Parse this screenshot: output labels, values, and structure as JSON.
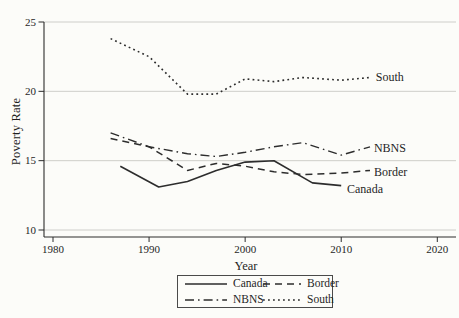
{
  "figure": {
    "background": "#fcfcf9",
    "line_color": "#2d2d2d",
    "grid_color": "#c9c9c4",
    "text_color": "#1f1f1f"
  },
  "chart_data": {
    "type": "line",
    "title": "",
    "xlabel": "Year",
    "ylabel": "Poverty Rate",
    "xlim": [
      1980,
      2020
    ],
    "ylim": [
      10,
      25
    ],
    "x_ticks": [
      1980,
      1990,
      2000,
      2010,
      2020
    ],
    "y_ticks": [
      10,
      15,
      20,
      25
    ],
    "grid": "horizontal-only",
    "legend_position": "bottom-center-boxed",
    "series": [
      {
        "name": "Canada",
        "dash": "solid",
        "label": "Canada",
        "label_pos": [
          2010.6,
          12.95
        ],
        "points": [
          [
            1987,
            14.6
          ],
          [
            1991,
            13.1
          ],
          [
            1994,
            13.5
          ],
          [
            1997,
            14.3
          ],
          [
            2000,
            14.9
          ],
          [
            2003,
            15.0
          ],
          [
            2007,
            13.4
          ],
          [
            2010,
            13.2
          ]
        ]
      },
      {
        "name": "Border",
        "dash": "dashed",
        "label": "Border",
        "label_pos": [
          2013.4,
          14.2
        ],
        "points": [
          [
            1986,
            16.6
          ],
          [
            1990,
            16.0
          ],
          [
            1994,
            14.3
          ],
          [
            1997,
            14.8
          ],
          [
            2000,
            14.6
          ],
          [
            2003,
            14.2
          ],
          [
            2006,
            14.0
          ],
          [
            2010,
            14.1
          ],
          [
            2013,
            14.3
          ]
        ]
      },
      {
        "name": "NBNS",
        "dash": "dashdot",
        "label": "NBNS",
        "label_pos": [
          2013.4,
          15.9
        ],
        "points": [
          [
            1986,
            17.0
          ],
          [
            1990,
            16.0
          ],
          [
            1994,
            15.5
          ],
          [
            1997,
            15.3
          ],
          [
            2000,
            15.6
          ],
          [
            2003,
            16.0
          ],
          [
            2006,
            16.3
          ],
          [
            2010,
            15.4
          ],
          [
            2013,
            16.0
          ]
        ]
      },
      {
        "name": "South",
        "dash": "dotted",
        "label": "South",
        "label_pos": [
          2013.6,
          21.05
        ],
        "points": [
          [
            1986,
            23.8
          ],
          [
            1990,
            22.5
          ],
          [
            1994,
            19.8
          ],
          [
            1997,
            19.8
          ],
          [
            2000,
            20.9
          ],
          [
            2003,
            20.7
          ],
          [
            2006,
            21.0
          ],
          [
            2010,
            20.8
          ],
          [
            2013,
            21.0
          ]
        ]
      }
    ],
    "legend": [
      {
        "label": "Canada",
        "dash": "solid"
      },
      {
        "label": "Border",
        "dash": "dashed"
      },
      {
        "label": "NBNS",
        "dash": "dashdot"
      },
      {
        "label": "South",
        "dash": "dotted"
      }
    ]
  }
}
